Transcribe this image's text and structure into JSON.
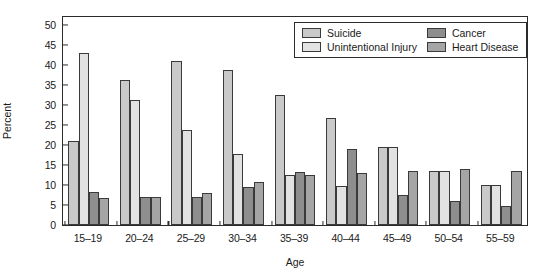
{
  "chart_data": {
    "type": "bar",
    "title": "",
    "xlabel": "Age",
    "ylabel": "Percent",
    "ylim": [
      0,
      52
    ],
    "yticks": [
      0,
      5,
      10,
      15,
      20,
      25,
      30,
      35,
      40,
      45,
      50
    ],
    "grid": false,
    "legend_position": "top-right",
    "categories": [
      "15–19",
      "20–24",
      "25–29",
      "30–34",
      "35–39",
      "40–44",
      "45–49",
      "50–54",
      "55–59"
    ],
    "series": [
      {
        "name": "Suicide",
        "color": "#c9c9c9",
        "values": [
          21.0,
          36.2,
          41.0,
          38.7,
          32.6,
          26.8,
          0.0,
          0.0,
          0.0
        ]
      },
      {
        "name": "Unintentional Injury",
        "color": "#e2e2e2",
        "values": [
          43.0,
          31.3,
          23.7,
          17.7,
          12.5,
          9.8,
          19.6,
          13.4,
          9.9
        ]
      },
      {
        "name": "Cancer",
        "color": "#8e8e8e",
        "values": [
          8.2,
          7.1,
          7.1,
          9.6,
          13.3,
          18.9,
          7.6,
          5.9,
          4.8
        ]
      },
      {
        "name": "Heart Disease",
        "color": "#a5a5a5",
        "values": [
          6.7,
          7.0,
          8.0,
          10.8,
          12.6,
          12.9,
          19.5,
          34.1,
          40.4
        ]
      }
    ],
    "series_extra_note": {
      "suicide_45_49": 19.6,
      "suicide_50_54": 13.4,
      "suicide_55_59": 9.9,
      "heart_45_49": 13.5,
      "heart_50_54": 14.0,
      "heart_55_59": 13.4
    }
  },
  "legend": {
    "entries": [
      {
        "label": "Suicide"
      },
      {
        "label": "Cancer"
      },
      {
        "label": "Unintentional Injury"
      },
      {
        "label": "Heart Disease"
      }
    ]
  }
}
